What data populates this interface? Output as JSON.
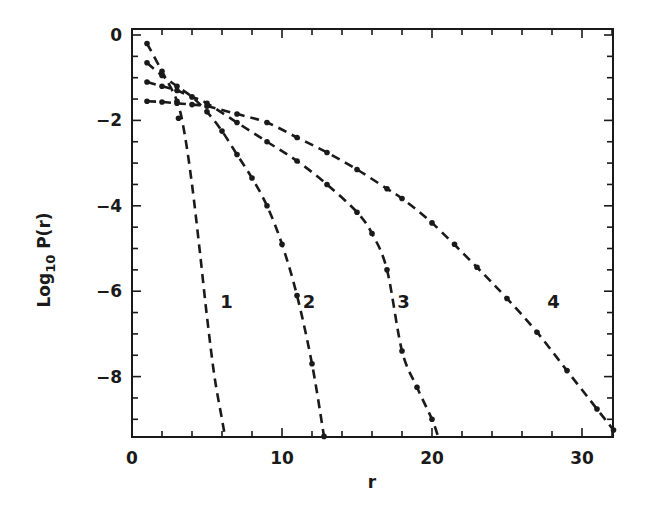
{
  "chart_data": {
    "type": "line",
    "title": "",
    "xlabel": "r",
    "ylabel": "Log10 P(r)",
    "ylabel_parts": {
      "base": "Log",
      "sub": "10",
      "rest": " P(r)"
    },
    "xlim": [
      0,
      32.1
    ],
    "ylim": [
      -9.4,
      0.15
    ],
    "x_ticks": [
      0,
      10,
      20,
      30
    ],
    "x_tick_labels": [
      "0",
      "10",
      "20",
      "30"
    ],
    "x_minor_step": 2,
    "y_ticks": [
      0,
      -2,
      -4,
      -6,
      -8
    ],
    "y_tick_labels": [
      "0",
      "-2",
      "-4",
      "-6",
      "-8"
    ],
    "y_minor_step": 0.5,
    "grid": false,
    "legend": "none (curves labeled inline)",
    "series": [
      {
        "name": "1",
        "label_pos": [
          6.3,
          -6.4
        ],
        "x": [
          1,
          2,
          3,
          3.5,
          4,
          4.5,
          5,
          5.5,
          6,
          6.2
        ],
        "values": [
          -0.2,
          -0.85,
          -1.55,
          -2.3,
          -3.5,
          -5.0,
          -6.6,
          -8.0,
          -9.0,
          -9.4
        ],
        "dots_x": [
          1,
          2,
          3,
          3.1
        ],
        "dots_y": [
          -0.2,
          -0.85,
          -1.55,
          -1.95
        ]
      },
      {
        "name": "2",
        "label_pos": [
          11.8,
          -6.4
        ],
        "x": [
          1,
          2,
          3,
          4,
          5,
          6,
          7,
          8,
          9,
          10,
          11,
          12,
          12.8
        ],
        "values": [
          -0.65,
          -0.95,
          -1.2,
          -1.45,
          -1.8,
          -2.25,
          -2.8,
          -3.35,
          -4.0,
          -4.9,
          -6.1,
          -7.7,
          -9.4
        ],
        "dots_x": [
          1,
          2,
          3,
          4,
          5,
          6,
          7,
          8,
          9,
          10,
          11,
          12,
          12.8
        ],
        "dots_y": [
          -0.65,
          -0.95,
          -1.2,
          -1.45,
          -1.8,
          -2.25,
          -2.8,
          -3.35,
          -4.0,
          -4.9,
          -6.1,
          -7.7,
          -9.4
        ]
      },
      {
        "name": "3",
        "label_pos": [
          18.1,
          -6.4
        ],
        "x": [
          1,
          2,
          3,
          4,
          5,
          7,
          9,
          11,
          13,
          15,
          16,
          17,
          18,
          19,
          20,
          20.4
        ],
        "values": [
          -1.1,
          -1.2,
          -1.3,
          -1.45,
          -1.6,
          -2.05,
          -2.5,
          -2.95,
          -3.5,
          -4.15,
          -4.65,
          -5.5,
          -7.4,
          -8.25,
          -9.0,
          -9.4
        ],
        "dots_x": [
          1,
          2,
          3,
          5,
          7,
          9,
          11,
          13,
          15,
          16,
          17,
          18,
          19,
          20
        ],
        "dots_y": [
          -1.1,
          -1.2,
          -1.3,
          -1.6,
          -2.05,
          -2.5,
          -2.95,
          -3.5,
          -4.15,
          -4.65,
          -5.5,
          -7.4,
          -8.25,
          -9.0
        ]
      },
      {
        "name": "4",
        "label_pos": [
          28.1,
          -6.4
        ],
        "x": [
          1,
          2,
          3,
          4,
          5,
          7,
          9,
          11,
          13,
          15,
          17,
          18,
          20,
          23,
          25,
          27,
          29,
          31,
          32.1
        ],
        "values": [
          -1.55,
          -1.57,
          -1.6,
          -1.63,
          -1.67,
          -1.85,
          -2.05,
          -2.4,
          -2.75,
          -3.15,
          -3.6,
          -3.83,
          -4.4,
          -5.44,
          -6.17,
          -6.96,
          -7.86,
          -8.76,
          -9.25
        ],
        "dots_x": [
          1,
          2,
          3,
          4,
          5,
          7,
          9,
          11,
          13,
          15,
          17,
          18,
          20,
          21.5,
          23,
          25,
          27,
          29,
          31,
          32.1
        ],
        "dots_y": [
          -1.55,
          -1.57,
          -1.6,
          -1.63,
          -1.67,
          -1.85,
          -2.05,
          -2.4,
          -2.75,
          -3.15,
          -3.6,
          -3.83,
          -4.4,
          -4.9,
          -5.44,
          -6.17,
          -6.96,
          -7.86,
          -8.76,
          -9.25
        ]
      }
    ]
  }
}
